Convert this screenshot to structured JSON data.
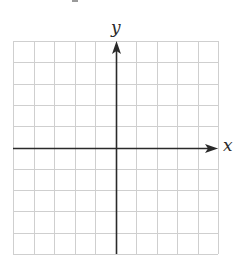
{
  "diagram": {
    "type": "coordinate-plane",
    "x_axis_label": "x",
    "y_axis_label": "y",
    "grid": {
      "columns": 10,
      "rows": 10,
      "left_px": 13,
      "top_px": 41,
      "right_px": 218,
      "bottom_px": 254,
      "line_color": "#cfcfcf"
    },
    "axes": {
      "origin_col": 5,
      "origin_row": 5,
      "color": "#2a2a2a",
      "x_arrow": "right",
      "y_arrow": "up"
    }
  }
}
